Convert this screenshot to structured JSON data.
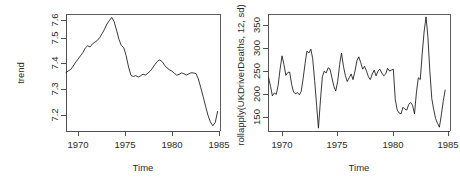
{
  "figure": {
    "type": "multi-panel-r-plot",
    "background": "#ffffff",
    "line_color": "#151515",
    "axis_color": "#3d3d3d",
    "panels": 2
  },
  "panel_left": {
    "ylabel": "trend",
    "xlabel": "Time",
    "ytick_labels": [
      "7.2",
      "7.3",
      "7.4",
      "7.5",
      "7.6"
    ],
    "xtick_labels": [
      "1970",
      "1975",
      "1980",
      "1985"
    ]
  },
  "panel_right": {
    "ylabel": "rollapply(UKDriverDeaths, 12, sd)",
    "xlabel": "Time",
    "ytick_labels": [
      "150",
      "200",
      "250",
      "300",
      "350"
    ],
    "xtick_labels": [
      "1970",
      "1975",
      "1980",
      "1985"
    ]
  },
  "chart_data": [
    {
      "type": "line",
      "title": "",
      "xlabel": "Time",
      "ylabel": "trend",
      "xlim": [
        1969.0,
        1985.0
      ],
      "ylim": [
        7.14,
        7.63
      ],
      "xticks": [
        1970,
        1975,
        1980,
        1985
      ],
      "yticks": [
        7.2,
        7.3,
        7.4,
        7.5,
        7.6
      ],
      "grid": false,
      "legend": "none",
      "x": [
        1969.0,
        1969.25,
        1969.5,
        1969.75,
        1970.0,
        1970.25,
        1970.5,
        1970.75,
        1971.0,
        1971.25,
        1971.5,
        1971.75,
        1972.0,
        1972.25,
        1972.5,
        1972.75,
        1973.0,
        1973.25,
        1973.5,
        1973.75,
        1974.0,
        1974.25,
        1974.5,
        1974.75,
        1975.0,
        1975.25,
        1975.5,
        1975.75,
        1976.0,
        1976.25,
        1976.5,
        1976.75,
        1977.0,
        1977.25,
        1977.5,
        1977.75,
        1978.0,
        1978.25,
        1978.5,
        1978.75,
        1979.0,
        1979.25,
        1979.5,
        1979.75,
        1980.0,
        1980.25,
        1980.5,
        1980.75,
        1981.0,
        1981.25,
        1981.5,
        1981.75,
        1982.0,
        1982.25,
        1982.5,
        1982.75,
        1983.0,
        1983.25,
        1983.5,
        1983.75,
        1984.0,
        1984.25,
        1984.5,
        1984.75
      ],
      "values": [
        7.385,
        7.392,
        7.398,
        7.412,
        7.428,
        7.441,
        7.455,
        7.468,
        7.487,
        7.497,
        7.492,
        7.505,
        7.512,
        7.519,
        7.531,
        7.548,
        7.566,
        7.588,
        7.602,
        7.616,
        7.598,
        7.563,
        7.524,
        7.498,
        7.489,
        7.455,
        7.408,
        7.373,
        7.368,
        7.372,
        7.366,
        7.371,
        7.378,
        7.374,
        7.382,
        7.391,
        7.404,
        7.419,
        7.432,
        7.438,
        7.43,
        7.415,
        7.404,
        7.396,
        7.391,
        7.382,
        7.374,
        7.377,
        7.383,
        7.38,
        7.374,
        7.379,
        7.384,
        7.383,
        7.381,
        7.358,
        7.322,
        7.284,
        7.244,
        7.206,
        7.178,
        7.162,
        7.175,
        7.222
      ]
    },
    {
      "type": "line",
      "title": "",
      "xlabel": "Time",
      "ylabel": "rollapply(UKDriverDeaths, 12, sd)",
      "xlim": [
        1969.2,
        1985.0
      ],
      "ylim": [
        132,
        378
      ],
      "xticks": [
        1970,
        1975,
        1980,
        1985
      ],
      "yticks": [
        150,
        200,
        250,
        300,
        350
      ],
      "grid": false,
      "legend": "none",
      "x": [
        1969.25,
        1969.42,
        1969.58,
        1969.75,
        1969.92,
        1970.08,
        1970.25,
        1970.42,
        1970.58,
        1970.75,
        1970.92,
        1971.08,
        1971.25,
        1971.42,
        1971.58,
        1971.75,
        1971.92,
        1972.08,
        1972.25,
        1972.42,
        1972.58,
        1972.75,
        1972.92,
        1973.08,
        1973.25,
        1973.42,
        1973.58,
        1973.75,
        1973.92,
        1974.08,
        1974.25,
        1974.42,
        1974.58,
        1974.75,
        1974.92,
        1975.08,
        1975.25,
        1975.42,
        1975.58,
        1975.75,
        1975.92,
        1976.08,
        1976.25,
        1976.42,
        1976.58,
        1976.75,
        1976.92,
        1977.08,
        1977.25,
        1977.42,
        1977.58,
        1977.75,
        1977.92,
        1978.08,
        1978.25,
        1978.42,
        1978.58,
        1978.75,
        1978.92,
        1979.08,
        1979.25,
        1979.42,
        1979.58,
        1979.75,
        1979.92,
        1980.08,
        1980.25,
        1980.42,
        1980.58,
        1980.75,
        1980.92,
        1981.08,
        1981.25,
        1981.42,
        1981.58,
        1981.75,
        1981.92,
        1982.08,
        1982.25,
        1982.42,
        1982.58,
        1982.75,
        1982.92,
        1983.08,
        1983.25,
        1983.42,
        1983.58,
        1983.75,
        1983.92,
        1984.08,
        1984.25,
        1984.42,
        1984.58
      ],
      "values": [
        244,
        226,
        206,
        212,
        209,
        228,
        262,
        290,
        272,
        249,
        255,
        256,
        230,
        214,
        210,
        213,
        208,
        215,
        242,
        274,
        300,
        296,
        304,
        284,
        238,
        186,
        138,
        196,
        246,
        258,
        254,
        265,
        262,
        244,
        226,
        216,
        236,
        272,
        296,
        268,
        248,
        236,
        244,
        252,
        240,
        258,
        280,
        288,
        276,
        262,
        268,
        258,
        246,
        240,
        252,
        260,
        248,
        258,
        262,
        254,
        248,
        252,
        264,
        258,
        260,
        262,
        198,
        176,
        170,
        168,
        182,
        178,
        176,
        188,
        192,
        186,
        168,
        212,
        244,
        240,
        292,
        340,
        372,
        330,
        258,
        200,
        178,
        158,
        148,
        140,
        166,
        196,
        218
      ]
    }
  ]
}
